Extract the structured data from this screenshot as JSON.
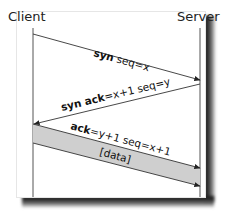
{
  "diagram": {
    "actors": {
      "left": "Client",
      "right": "Server"
    },
    "messages": [
      {
        "label_bold": "syn",
        "label_rest": " seq=x",
        "direction": "client-to-server"
      },
      {
        "label_bold": "syn ack",
        "label_rest": "=x+1 seq=y",
        "direction": "server-to-client"
      },
      {
        "label_bold": "ack",
        "label_rest": "=y+1 seq=x+1",
        "direction": "client-to-server"
      },
      {
        "label_bold": "",
        "label_rest": "[data]",
        "direction": "client-to-server"
      }
    ],
    "colors": {
      "band_fill": "#cfcfcf",
      "line": "#333333",
      "lifeline": "#555555",
      "shadow": "#1a1a1a"
    }
  }
}
